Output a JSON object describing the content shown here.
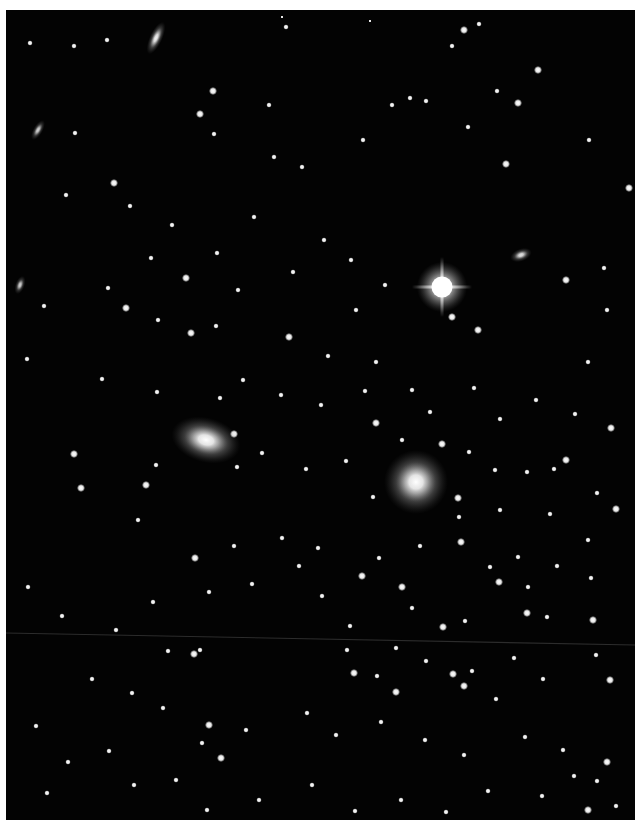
{
  "image": {
    "subject": "galaxy cluster star field photograph",
    "background_color": "#030303",
    "border_color": "#ffffff",
    "plate": {
      "x": 6,
      "y": 10,
      "w": 629,
      "h": 810
    }
  },
  "scanline": {
    "x1": 0,
    "y1": 623,
    "x2": 629,
    "y2": 635
  },
  "bright_star": {
    "x": 436,
    "y": 277,
    "r": 14,
    "spike": 30
  },
  "galaxies": [
    {
      "x": 200,
      "y": 430,
      "rx": 22,
      "ry": 14,
      "rot": 15,
      "glow": 1.0
    },
    {
      "x": 410,
      "y": 472,
      "rx": 20,
      "ry": 20,
      "rot": 0,
      "glow": 1.0
    },
    {
      "x": 150,
      "y": 28,
      "rx": 4,
      "ry": 11,
      "rot": 25,
      "glow": 0.9
    },
    {
      "x": 515,
      "y": 245,
      "rx": 7,
      "ry": 4,
      "rot": -20,
      "glow": 0.8
    },
    {
      "x": 32,
      "y": 120,
      "rx": 3,
      "ry": 7,
      "rot": 30,
      "glow": 0.7
    },
    {
      "x": 14,
      "y": 275,
      "rx": 3,
      "ry": 6,
      "rot": 20,
      "glow": 0.7
    }
  ],
  "stars": [
    [
      24,
      33,
      2
    ],
    [
      68,
      36,
      2
    ],
    [
      101,
      30,
      2
    ],
    [
      276,
      7,
      1
    ],
    [
      364,
      11,
      1
    ],
    [
      280,
      17,
      2
    ],
    [
      458,
      20,
      3
    ],
    [
      473,
      14,
      2
    ],
    [
      446,
      36,
      2
    ],
    [
      532,
      60,
      3
    ],
    [
      207,
      81,
      3
    ],
    [
      263,
      95,
      2
    ],
    [
      386,
      95,
      2
    ],
    [
      404,
      88,
      2
    ],
    [
      420,
      91,
      2
    ],
    [
      491,
      81,
      2
    ],
    [
      512,
      93,
      3
    ],
    [
      69,
      123,
      2
    ],
    [
      108,
      173,
      3
    ],
    [
      194,
      104,
      3
    ],
    [
      208,
      124,
      2
    ],
    [
      268,
      147,
      2
    ],
    [
      296,
      157,
      2
    ],
    [
      357,
      130,
      2
    ],
    [
      462,
      117,
      2
    ],
    [
      500,
      154,
      3
    ],
    [
      623,
      178,
      3
    ],
    [
      583,
      130,
      2
    ],
    [
      60,
      185,
      2
    ],
    [
      124,
      196,
      2
    ],
    [
      166,
      215,
      2
    ],
    [
      211,
      243,
      2
    ],
    [
      248,
      207,
      2
    ],
    [
      318,
      230,
      2
    ],
    [
      345,
      250,
      2
    ],
    [
      287,
      262,
      2
    ],
    [
      350,
      300,
      2
    ],
    [
      379,
      275,
      2
    ],
    [
      232,
      280,
      2
    ],
    [
      145,
      248,
      2
    ],
    [
      180,
      268,
      3
    ],
    [
      102,
      278,
      2
    ],
    [
      120,
      298,
      3
    ],
    [
      152,
      310,
      2
    ],
    [
      210,
      316,
      2
    ],
    [
      185,
      323,
      3
    ],
    [
      283,
      327,
      3
    ],
    [
      322,
      346,
      2
    ],
    [
      370,
      352,
      2
    ],
    [
      446,
      307,
      3
    ],
    [
      472,
      320,
      3
    ],
    [
      560,
      270,
      3
    ],
    [
      598,
      258,
      2
    ],
    [
      601,
      300,
      2
    ],
    [
      582,
      352,
      2
    ],
    [
      38,
      296,
      2
    ],
    [
      21,
      349,
      2
    ],
    [
      96,
      369,
      2
    ],
    [
      151,
      382,
      2
    ],
    [
      214,
      388,
      2
    ],
    [
      237,
      370,
      2
    ],
    [
      275,
      385,
      2
    ],
    [
      315,
      395,
      2
    ],
    [
      359,
      381,
      2
    ],
    [
      406,
      380,
      2
    ],
    [
      424,
      402,
      2
    ],
    [
      468,
      378,
      2
    ],
    [
      494,
      409,
      2
    ],
    [
      530,
      390,
      2
    ],
    [
      569,
      404,
      2
    ],
    [
      605,
      418,
      3
    ],
    [
      68,
      444,
      3
    ],
    [
      75,
      478,
      3
    ],
    [
      140,
      475,
      3
    ],
    [
      150,
      455,
      2
    ],
    [
      132,
      510,
      2
    ],
    [
      228,
      424,
      3
    ],
    [
      231,
      457,
      2
    ],
    [
      256,
      443,
      2
    ],
    [
      300,
      459,
      2
    ],
    [
      340,
      451,
      2
    ],
    [
      370,
      413,
      3
    ],
    [
      396,
      430,
      2
    ],
    [
      436,
      434,
      3
    ],
    [
      463,
      442,
      2
    ],
    [
      489,
      460,
      2
    ],
    [
      521,
      462,
      2
    ],
    [
      548,
      459,
      2
    ],
    [
      560,
      450,
      3
    ],
    [
      591,
      483,
      2
    ],
    [
      610,
      499,
      3
    ],
    [
      367,
      487,
      2
    ],
    [
      452,
      488,
      3
    ],
    [
      453,
      507,
      2
    ],
    [
      494,
      500,
      2
    ],
    [
      544,
      504,
      2
    ],
    [
      582,
      530,
      2
    ],
    [
      189,
      548,
      3
    ],
    [
      228,
      536,
      2
    ],
    [
      276,
      528,
      2
    ],
    [
      293,
      556,
      2
    ],
    [
      312,
      538,
      2
    ],
    [
      356,
      566,
      3
    ],
    [
      373,
      548,
      2
    ],
    [
      414,
      536,
      2
    ],
    [
      455,
      532,
      3
    ],
    [
      484,
      557,
      2
    ],
    [
      512,
      547,
      2
    ],
    [
      493,
      572,
      3
    ],
    [
      522,
      577,
      2
    ],
    [
      551,
      556,
      2
    ],
    [
      585,
      568,
      2
    ],
    [
      396,
      577,
      3
    ],
    [
      22,
      577,
      2
    ],
    [
      56,
      606,
      2
    ],
    [
      110,
      620,
      2
    ],
    [
      147,
      592,
      2
    ],
    [
      203,
      582,
      2
    ],
    [
      246,
      574,
      2
    ],
    [
      316,
      586,
      2
    ],
    [
      344,
      616,
      2
    ],
    [
      406,
      598,
      2
    ],
    [
      437,
      617,
      3
    ],
    [
      459,
      611,
      2
    ],
    [
      521,
      603,
      3
    ],
    [
      541,
      607,
      2
    ],
    [
      587,
      610,
      3
    ],
    [
      162,
      641,
      2
    ],
    [
      188,
      644,
      3
    ],
    [
      194,
      640,
      2
    ],
    [
      341,
      640,
      2
    ],
    [
      390,
      638,
      2
    ],
    [
      420,
      651,
      2
    ],
    [
      447,
      664,
      3
    ],
    [
      466,
      661,
      2
    ],
    [
      508,
      648,
      2
    ],
    [
      537,
      669,
      2
    ],
    [
      590,
      645,
      2
    ],
    [
      604,
      670,
      3
    ],
    [
      348,
      663,
      3
    ],
    [
      371,
      666,
      2
    ],
    [
      390,
      682,
      3
    ],
    [
      458,
      676,
      3
    ],
    [
      490,
      689,
      2
    ],
    [
      86,
      669,
      2
    ],
    [
      126,
      683,
      2
    ],
    [
      157,
      698,
      2
    ],
    [
      203,
      715,
      3
    ],
    [
      215,
      748,
      3
    ],
    [
      240,
      720,
      2
    ],
    [
      301,
      703,
      2
    ],
    [
      330,
      725,
      2
    ],
    [
      375,
      712,
      2
    ],
    [
      419,
      730,
      2
    ],
    [
      458,
      745,
      2
    ],
    [
      519,
      727,
      2
    ],
    [
      557,
      740,
      2
    ],
    [
      601,
      752,
      3
    ],
    [
      591,
      771,
      2
    ],
    [
      610,
      796,
      2
    ],
    [
      582,
      800,
      3
    ],
    [
      30,
      716,
      2
    ],
    [
      62,
      752,
      2
    ],
    [
      103,
      741,
      2
    ],
    [
      128,
      775,
      2
    ],
    [
      170,
      770,
      2
    ],
    [
      201,
      800,
      2
    ],
    [
      253,
      790,
      2
    ],
    [
      306,
      775,
      2
    ],
    [
      349,
      801,
      2
    ],
    [
      395,
      790,
      2
    ],
    [
      440,
      802,
      2
    ],
    [
      482,
      781,
      2
    ],
    [
      536,
      786,
      2
    ],
    [
      568,
      766,
      2
    ],
    [
      196,
      733,
      2
    ],
    [
      41,
      783,
      2
    ]
  ]
}
